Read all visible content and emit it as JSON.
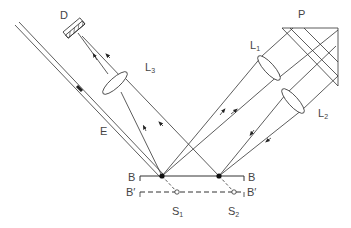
{
  "diagram": {
    "title": "",
    "colors": {
      "line": "#333333",
      "label": "#444444",
      "background": "#ffffff"
    },
    "labels": {
      "detector": "D",
      "prism": "P",
      "lens1_main": "L",
      "lens1_sub": "1",
      "lens2_main": "L",
      "lens2_sub": "2",
      "lens3_main": "L",
      "lens3_sub": "3",
      "beam": "E",
      "mirror_left": "B",
      "mirror_right": "B",
      "image_left": "B′",
      "image_right": "B′",
      "source1_main": "S",
      "source1_sub": "1",
      "source2_main": "S",
      "source2_sub": "2"
    },
    "components": [
      {
        "id": "D",
        "type": "detector",
        "x": 73,
        "y": 27
      },
      {
        "id": "L3",
        "type": "lens",
        "x": 115,
        "y": 83
      },
      {
        "id": "L1",
        "type": "lens",
        "x": 269,
        "y": 68
      },
      {
        "id": "L2",
        "type": "lens",
        "x": 293,
        "y": 101
      },
      {
        "id": "P",
        "type": "prism",
        "x": 310,
        "y": 50
      },
      {
        "id": "B",
        "type": "mirror",
        "y": 176
      },
      {
        "id": "B'",
        "type": "virtual-mirror",
        "y": 192
      },
      {
        "id": "S1",
        "type": "virtual-source",
        "x": 177,
        "y": 192
      },
      {
        "id": "S2",
        "type": "virtual-source",
        "x": 234,
        "y": 192
      }
    ]
  }
}
